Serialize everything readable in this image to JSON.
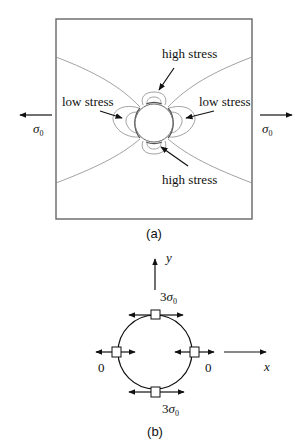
{
  "figure": {
    "panel_a": {
      "caption": "(a)",
      "labels": {
        "high_stress_top": "high stress",
        "high_stress_bottom": "high stress",
        "low_stress_left": "low stress",
        "low_stress_right": "low stress"
      },
      "load_left": {
        "symbol": "σ",
        "subscript": "0"
      },
      "load_right": {
        "symbol": "σ",
        "subscript": "0"
      }
    },
    "panel_b": {
      "caption": "(b)",
      "axis_y": "y",
      "axis_x": "x",
      "top_value": {
        "coef": "3",
        "symbol": "σ",
        "subscript": "0"
      },
      "bottom_value": {
        "coef": "3",
        "symbol": "σ",
        "subscript": "0"
      },
      "left_value": "0",
      "right_value": "0"
    }
  }
}
